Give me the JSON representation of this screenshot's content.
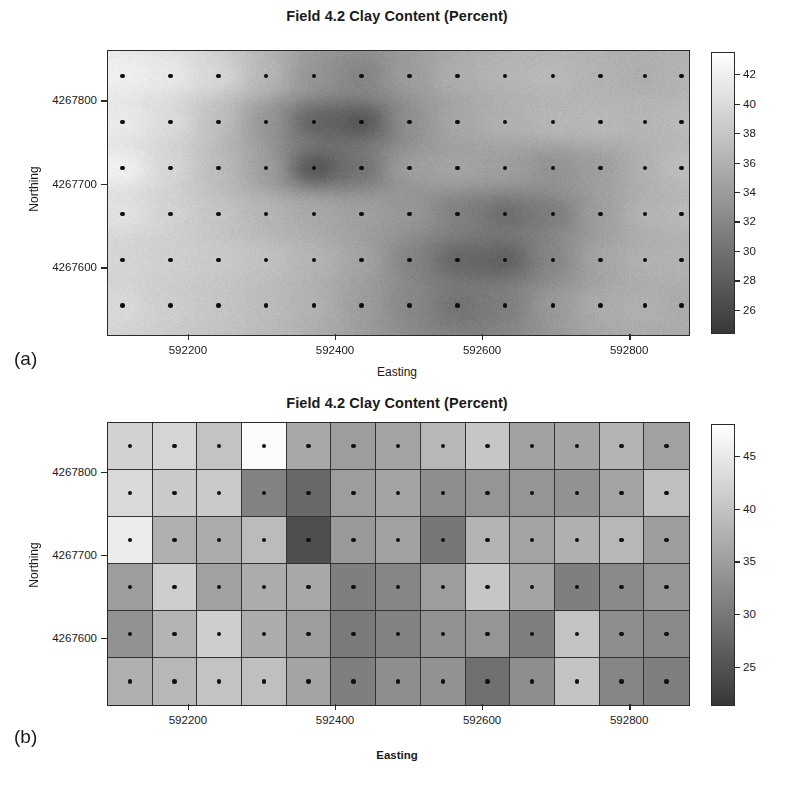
{
  "figure": {
    "panels": [
      {
        "tag": "(a)",
        "title": "Field 4.2 Clay Content (Percent)",
        "type": "interpolated-surface"
      },
      {
        "tag": "(b)",
        "title": "Field 4.2 Clay Content (Percent)",
        "type": "raster-grid"
      }
    ]
  },
  "axes": {
    "xlabel": "Easting",
    "ylabel": "Northing",
    "xticks": [
      "592200",
      "592400",
      "592600",
      "592800"
    ],
    "yticks": [
      "4267600",
      "4267700",
      "4267800"
    ]
  },
  "chart_data": [
    {
      "type": "heatmap",
      "panel": "(a)",
      "title": "Field 4.2 Clay Content (Percent)",
      "xlabel": "Easting",
      "ylabel": "Northing",
      "subtitle": "Smoothly interpolated (kriged) clay content surface with sample locations marked as dots",
      "colormap": "grayscale-reversed",
      "colorbar": {
        "ticks": [
          26,
          28,
          30,
          32,
          34,
          36,
          38,
          40,
          42
        ],
        "vmin": 24.5,
        "vmax": 43.5,
        "position": "right"
      },
      "xlim": [
        592090,
        592880
      ],
      "ylim": [
        4267520,
        4267860
      ],
      "xticks": [
        592200,
        592400,
        592600,
        592800
      ],
      "yticks": [
        4267600,
        4267700,
        4267800
      ],
      "grid": false,
      "sample_grid": {
        "ncols": 13,
        "nrows": 6
      },
      "x": [
        592110,
        592175,
        592240,
        592305,
        592370,
        592435,
        592500,
        592565,
        592630,
        592695,
        592760,
        592820,
        592870
      ],
      "y": [
        4267830,
        4267775,
        4267720,
        4267665,
        4267610,
        4267555
      ],
      "values": [
        [
          25.8,
          26.4,
          28.0,
          31.2,
          34.8,
          36.6,
          33.8,
          32.0,
          31.4,
          31.0,
          31.8,
          32.4,
          31.6
        ],
        [
          26.2,
          27.6,
          30.4,
          34.6,
          40.2,
          41.8,
          35.0,
          32.6,
          31.8,
          31.2,
          31.0,
          31.6,
          30.8
        ],
        [
          25.4,
          28.2,
          30.8,
          33.4,
          42.2,
          38.4,
          33.2,
          32.8,
          33.6,
          35.2,
          34.0,
          31.8,
          30.4
        ],
        [
          27.0,
          28.6,
          30.0,
          31.4,
          32.6,
          33.4,
          34.2,
          36.8,
          39.0,
          37.4,
          33.6,
          31.4,
          31.0
        ],
        [
          28.4,
          29.0,
          29.4,
          30.2,
          31.4,
          33.0,
          36.4,
          39.6,
          40.4,
          36.2,
          32.8,
          31.6,
          31.8
        ],
        [
          28.0,
          29.2,
          30.0,
          30.8,
          31.8,
          33.8,
          36.0,
          38.2,
          37.0,
          34.0,
          32.2,
          31.8,
          32.6
        ]
      ]
    },
    {
      "type": "heatmap",
      "panel": "(b)",
      "title": "Field 4.2 Clay Content (Percent)",
      "xlabel": "Easting",
      "ylabel": "Northing",
      "subtitle": "Block-averaged (raster cell) clay content with one sample point per cell",
      "colormap": "grayscale-reversed",
      "colorbar": {
        "ticks": [
          25,
          30,
          35,
          40,
          45
        ],
        "vmin": 21.5,
        "vmax": 48.0,
        "position": "right"
      },
      "xlim": [
        592090,
        592880
      ],
      "ylim": [
        4267520,
        4267860
      ],
      "xticks": [
        592200,
        592400,
        592600,
        592800
      ],
      "yticks": [
        4267600,
        4267700,
        4267800
      ],
      "grid": true,
      "cell_grid": {
        "ncols": 13,
        "nrows": 6
      },
      "x": [
        592110,
        592175,
        592240,
        592305,
        592370,
        592435,
        592500,
        592565,
        592630,
        592695,
        592760,
        592820,
        592870
      ],
      "y": [
        4267830,
        4267775,
        4267720,
        4267665,
        4267610,
        4267555
      ],
      "values": [
        [
          27.5,
          27.0,
          29.5,
          22.0,
          33.0,
          34.5,
          33.5,
          31.0,
          29.0,
          34.0,
          33.5,
          31.5,
          34.0
        ],
        [
          26.5,
          28.5,
          28.5,
          38.0,
          41.5,
          34.5,
          33.5,
          36.5,
          35.5,
          35.5,
          36.0,
          33.5,
          30.0
        ],
        [
          24.0,
          32.0,
          32.5,
          30.5,
          45.0,
          35.0,
          34.0,
          39.5,
          31.5,
          33.5,
          32.0,
          31.0,
          34.5
        ],
        [
          34.5,
          28.0,
          34.0,
          32.5,
          33.0,
          38.5,
          37.5,
          34.5,
          29.0,
          33.5,
          38.5,
          37.0,
          35.5
        ],
        [
          36.0,
          31.5,
          28.0,
          32.5,
          34.5,
          39.0,
          38.0,
          36.0,
          35.5,
          38.5,
          29.5,
          36.5,
          37.0
        ],
        [
          32.0,
          31.0,
          29.5,
          30.0,
          33.5,
          38.5,
          36.5,
          36.0,
          40.5,
          36.5,
          29.5,
          37.5,
          38.5
        ]
      ]
    }
  ]
}
